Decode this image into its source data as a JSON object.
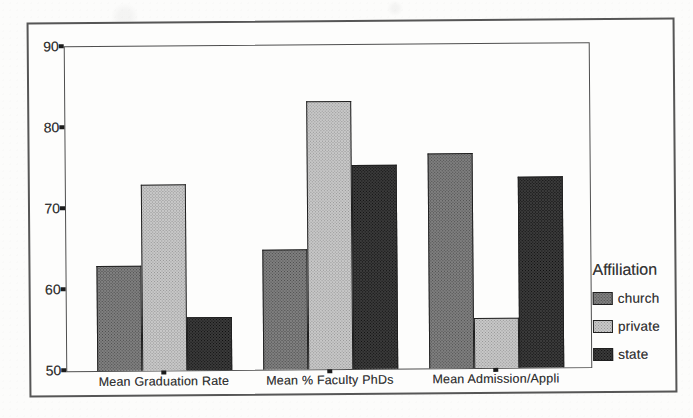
{
  "chart_data": {
    "type": "bar",
    "title": "",
    "categories": [
      "Mean Graduation Rate",
      "Mean % Faculty PhDs",
      "Mean Admission/Appli"
    ],
    "series": [
      {
        "name": "church",
        "values": [
          63.0,
          64.8,
          76.5
        ],
        "color": "#808080",
        "dot_color": "#4a4a4a"
      },
      {
        "name": "private",
        "values": [
          73.0,
          83.1,
          56.2
        ],
        "color": "#c8c8c8",
        "dot_color": "#949494"
      },
      {
        "name": "state",
        "values": [
          56.6,
          75.2,
          73.6
        ],
        "color": "#3b3b3b",
        "dot_color": "#0d0d0d"
      }
    ],
    "ylim": [
      50,
      90
    ],
    "yticks": [
      50,
      60,
      70,
      80,
      90
    ],
    "xlabel": "",
    "ylabel": "",
    "grid": false,
    "legend": {
      "title": "Affiliation",
      "position": "right",
      "entries": [
        "church",
        "private",
        "state"
      ]
    }
  }
}
